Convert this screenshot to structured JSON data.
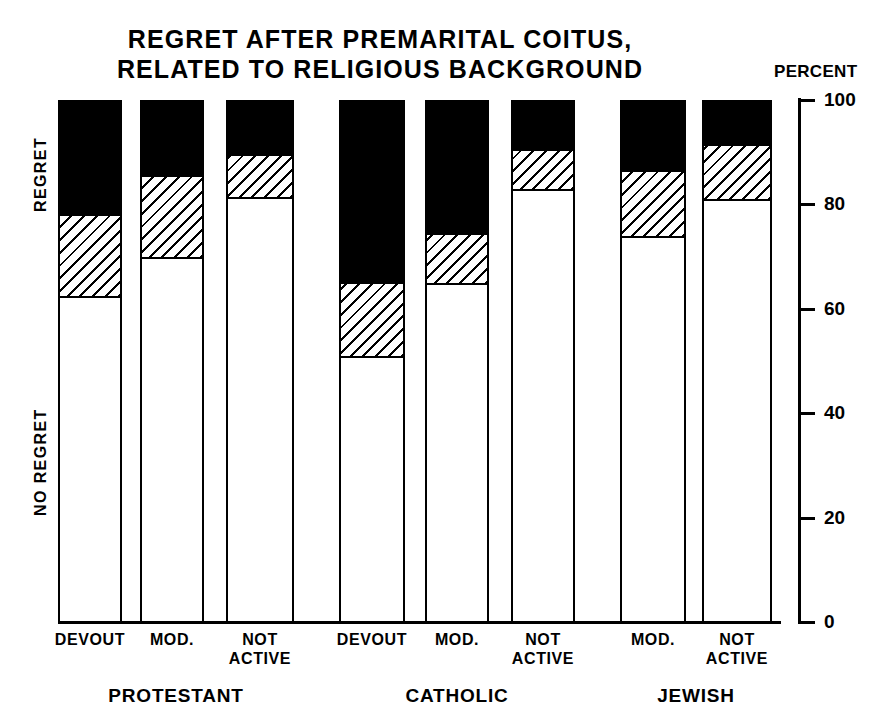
{
  "title": {
    "line1": "REGRET AFTER PREMARITAL COITUS,",
    "line2": "RELATED TO RELIGIOUS BACKGROUND"
  },
  "axis": {
    "caption": "PERCENT",
    "ticks": [
      "100",
      "80",
      "60",
      "40",
      "20",
      "0"
    ]
  },
  "side_labels": {
    "regret": "REGRET",
    "no_regret": "NO REGRET"
  },
  "groups": [
    {
      "name": "PROTESTANT",
      "categories": [
        "DEVOUT",
        "MOD.",
        "NOT ACTIVE"
      ]
    },
    {
      "name": "CATHOLIC",
      "categories": [
        "DEVOUT",
        "MOD.",
        "NOT ACTIVE"
      ]
    },
    {
      "name": "JEWISH",
      "categories": [
        "MOD.",
        "NOT ACTIVE"
      ]
    }
  ],
  "chart_data": {
    "type": "bar",
    "subtype": "stacked-100-percent",
    "title": "REGRET AFTER PREMARITAL COITUS, RELATED TO RELIGIOUS BACKGROUND",
    "xlabel": "",
    "ylabel": "PERCENT",
    "ylim": [
      0,
      100
    ],
    "yticks": [
      0,
      20,
      40,
      60,
      80,
      100
    ],
    "grid": false,
    "legend": false,
    "axis_position": "right",
    "categories": [
      "PROTESTANT DEVOUT",
      "PROTESTANT MOD.",
      "PROTESTANT NOT ACTIVE",
      "CATHOLIC DEVOUT",
      "CATHOLIC MOD.",
      "CATHOLIC NOT ACTIVE",
      "JEWISH MOD.",
      "JEWISH NOT ACTIVE"
    ],
    "series": [
      {
        "name": "NO REGRET",
        "fill": "white",
        "values": [
          62.5,
          70,
          81.5,
          51,
          65,
          83,
          74,
          81
        ]
      },
      {
        "name": "SOME REGRET",
        "fill": "hatched",
        "values": [
          16,
          16,
          8.5,
          14.5,
          10,
          8,
          13,
          11
        ]
      },
      {
        "name": "REGRET",
        "fill": "black",
        "values": [
          21.5,
          14,
          10,
          34.5,
          25,
          9,
          13,
          8
        ]
      }
    ],
    "segment_boundaries_percent": [
      {
        "category": "PROTESTANT DEVOUT",
        "white_top": 62.5,
        "hatch_top": 78.5
      },
      {
        "category": "PROTESTANT MOD.",
        "white_top": 70,
        "hatch_top": 86
      },
      {
        "category": "PROTESTANT NOT ACTIVE",
        "white_top": 81.5,
        "hatch_top": 90
      },
      {
        "category": "CATHOLIC DEVOUT",
        "white_top": 51,
        "hatch_top": 65.5
      },
      {
        "category": "CATHOLIC MOD.",
        "white_top": 65,
        "hatch_top": 75
      },
      {
        "category": "CATHOLIC NOT ACTIVE",
        "white_top": 83,
        "hatch_top": 91
      },
      {
        "category": "JEWISH MOD.",
        "white_top": 74,
        "hatch_top": 87
      },
      {
        "category": "JEWISH NOT ACTIVE",
        "white_top": 81,
        "hatch_top": 92
      }
    ]
  },
  "layout": {
    "bars": [
      {
        "id": "protestant-devout",
        "left": 58,
        "width": 64,
        "group": 0,
        "cat": 0
      },
      {
        "id": "protestant-mod",
        "left": 140,
        "width": 64,
        "group": 0,
        "cat": 1
      },
      {
        "id": "protestant-not-active",
        "left": 226,
        "width": 68,
        "group": 0,
        "cat": 2
      },
      {
        "id": "catholic-devout",
        "left": 339,
        "width": 66,
        "group": 1,
        "cat": 0
      },
      {
        "id": "catholic-mod",
        "left": 425,
        "width": 64,
        "group": 1,
        "cat": 1
      },
      {
        "id": "catholic-not-active",
        "left": 511,
        "width": 64,
        "group": 1,
        "cat": 2
      },
      {
        "id": "jewish-mod",
        "left": 620,
        "width": 66,
        "group": 2,
        "cat": 0
      },
      {
        "id": "jewish-not-active",
        "left": 702,
        "width": 70,
        "group": 2,
        "cat": 1
      }
    ],
    "group_label_positions": [
      {
        "left": 58,
        "width": 236
      },
      {
        "left": 339,
        "width": 236
      },
      {
        "left": 620,
        "width": 152
      }
    ],
    "colors": {
      "ink": "#000000",
      "paper": "#ffffff"
    }
  }
}
